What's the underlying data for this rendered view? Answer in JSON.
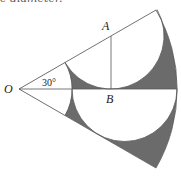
{
  "header": {
    "cut_text": "e diameter."
  },
  "labels": {
    "O": "O",
    "A": "A",
    "B": "B",
    "angle": "30°"
  },
  "colors": {
    "shade": "#6b6b6b",
    "line": "#555555",
    "background": "#ffffff"
  },
  "geometry": {
    "origin": [
      19,
      89
    ],
    "outer_radius": 158,
    "inner_radius": 53,
    "sector_angle_deg": 60,
    "half_angle_deg": 30,
    "point_A": [
      111,
      36
    ],
    "point_B": [
      111,
      89
    ]
  }
}
